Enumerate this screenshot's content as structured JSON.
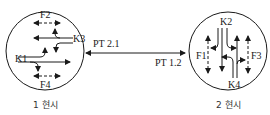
{
  "diagram": {
    "type": "phase-transition",
    "colors": {
      "stroke": "#1a1a1a",
      "background": "#ffffff"
    },
    "phases": [
      {
        "caption": "1 현시",
        "labels": {
          "top": "F2",
          "right": "K3",
          "left": "K1",
          "bottom": "F4"
        }
      },
      {
        "caption": "2 현시",
        "labels": {
          "top": "K2",
          "left": "F1",
          "right": "F3",
          "bottom": "K4"
        }
      }
    ],
    "transition": {
      "label_2_1": "PT 2.1",
      "label_1_2": "PT 1.2"
    }
  }
}
